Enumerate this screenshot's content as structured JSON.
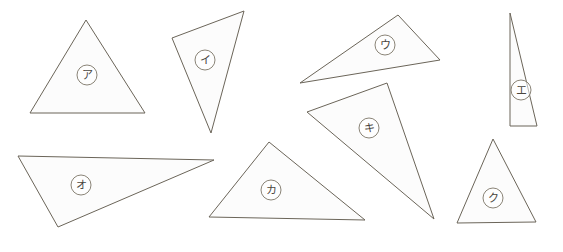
{
  "page": {
    "background_color": "#ffffff",
    "width": 563,
    "height": 252
  },
  "style": {
    "shape_fill": "#fcfcfc",
    "shape_stroke": "#6b6559",
    "label_stroke": "#7d7668",
    "label_text_color": "#4a463e"
  },
  "shapes": [
    {
      "id": "triangle-a",
      "label": "ア",
      "label_circled": "㋐",
      "points": "86,20 30,113 145,113",
      "label_x": 87,
      "label_y": 75,
      "label_r": 10
    },
    {
      "id": "triangle-i",
      "label": "イ",
      "label_circled": "㋑",
      "points": "244,11 172,38 211,133",
      "label_x": 205,
      "label_y": 60,
      "label_r": 10
    },
    {
      "id": "triangle-u",
      "label": "ウ",
      "label_circled": "㋒",
      "points": "398,15 440,60 300,83",
      "label_x": 385,
      "label_y": 45,
      "label_r": 10
    },
    {
      "id": "triangle-e",
      "label": "エ",
      "label_circled": "㋓",
      "points": "510,13 510,126 537,126",
      "label_x": 521,
      "label_y": 90,
      "label_r": 10
    },
    {
      "id": "triangle-o",
      "label": "オ",
      "label_circled": "㋔",
      "points": "18,156 214,160 58,227",
      "label_x": 81,
      "label_y": 185,
      "label_r": 10
    },
    {
      "id": "triangle-ka",
      "label": "カ",
      "label_circled": "㋕",
      "points": "269,142 209,217 365,220",
      "label_x": 271,
      "label_y": 190,
      "label_r": 10
    },
    {
      "id": "triangle-ki",
      "label": "キ",
      "label_circled": "㋖",
      "points": "387,83 307,112 434,219",
      "label_x": 369,
      "label_y": 128,
      "label_r": 10
    },
    {
      "id": "triangle-ku",
      "label": "ク",
      "label_circled": "㋗",
      "points": "493,139 457,223 536,222",
      "label_x": 493,
      "label_y": 198,
      "label_r": 10
    }
  ]
}
